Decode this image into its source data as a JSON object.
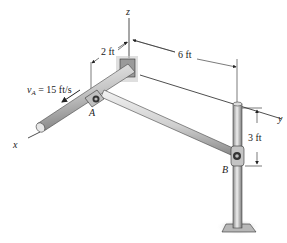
{
  "diagram": {
    "axes": {
      "x": "x",
      "y": "y",
      "z": "z"
    },
    "dimensions": {
      "offset_x": "2 ft",
      "span_y": "6 ft",
      "height_z": "3 ft"
    },
    "points": {
      "A": "A",
      "B": "B"
    },
    "velocity": {
      "symbol": "v",
      "subscript": "A",
      "equals": " = 15 ft/s"
    },
    "colors": {
      "rod_light": "#e6e6e6",
      "rod_dark": "#8a8a8a",
      "line": "#222222",
      "plate": "#9a9a9a",
      "shadow": "#bdbdbd"
    }
  }
}
